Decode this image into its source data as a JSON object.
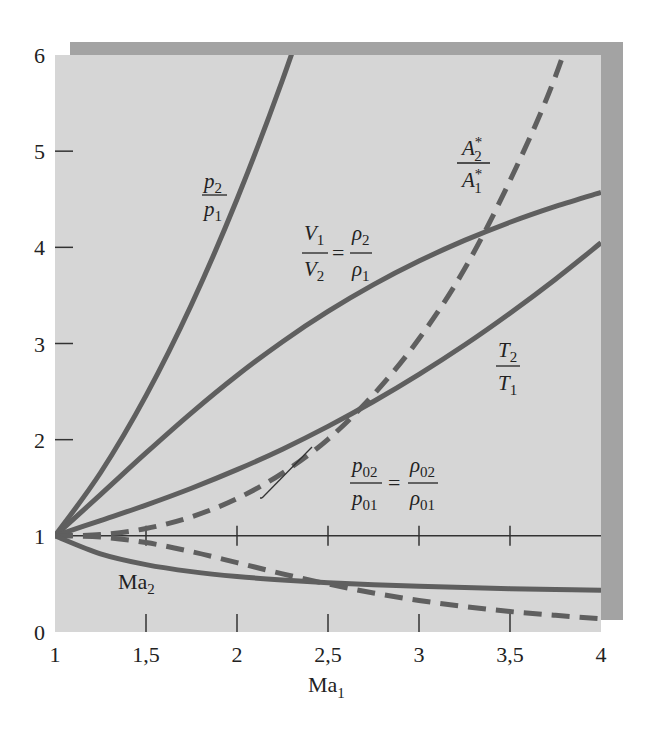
{
  "chart_data": {
    "type": "line",
    "title": "",
    "xlabel": "Ma1",
    "ylabel": "",
    "xlim": [
      1,
      4
    ],
    "ylim": [
      0,
      6
    ],
    "grid": false,
    "legend": "inline curve labels",
    "x_ticks": [
      "1",
      "1,5",
      "2",
      "2,5",
      "3",
      "3,5",
      "4"
    ],
    "y_ticks": [
      "0",
      "1",
      "2",
      "3",
      "4",
      "5",
      "6"
    ],
    "x": [
      1,
      1.25,
      1.5,
      1.75,
      2,
      2.25,
      2.5,
      2.75,
      3,
      3.25,
      3.5,
      3.75,
      4
    ],
    "series": [
      {
        "name": "p2/p1",
        "style": "solid",
        "values": [
          1,
          1.656,
          2.458,
          3.406,
          4.5,
          5.74,
          7.125,
          null,
          null,
          null,
          null,
          null,
          null
        ]
      },
      {
        "name": "V1/V2 = rho2/rho1",
        "style": "solid",
        "values": [
          1,
          1.429,
          1.862,
          2.279,
          2.667,
          3.019,
          3.333,
          3.612,
          3.857,
          4.072,
          4.261,
          4.426,
          4.571
        ]
      },
      {
        "name": "T2/T1",
        "style": "solid",
        "values": [
          1,
          1.159,
          1.32,
          1.495,
          1.688,
          1.901,
          2.138,
          2.397,
          2.679,
          2.984,
          3.315,
          3.669,
          4.047
        ]
      },
      {
        "name": "A2*/A1*",
        "style": "dashed",
        "values": [
          1,
          1.013,
          1.076,
          1.198,
          1.387,
          1.653,
          2.004,
          2.469,
          3.049,
          3.774,
          4.695,
          5.78,
          7.195
        ]
      },
      {
        "name": "p02/p01 = rho02/rho01",
        "style": "dashed",
        "values": [
          1,
          0.987,
          0.93,
          0.835,
          0.721,
          0.605,
          0.499,
          0.405,
          0.328,
          0.265,
          0.213,
          0.173,
          0.139
        ]
      },
      {
        "name": "Ma2",
        "style": "solid",
        "values": [
          1,
          0.813,
          0.701,
          0.628,
          0.577,
          0.541,
          0.513,
          0.492,
          0.475,
          0.462,
          0.451,
          0.442,
          0.435
        ]
      }
    ],
    "reference_line": {
      "name": "y = 1",
      "y": 1
    },
    "annotations": [
      {
        "text": "p2/p1",
        "x": 1.85,
        "y": 4.6
      },
      {
        "text": "V1/V2 = rho2/rho1",
        "x": 2.5,
        "y": 3.9
      },
      {
        "text": "A2*/A1*",
        "x": 3.25,
        "y": 5.0
      },
      {
        "text": "T2/T1",
        "x": 3.5,
        "y": 2.9
      },
      {
        "text": "p02/p01 = rho02/rho01",
        "x": 2.75,
        "y": 1.7
      },
      {
        "text": "Ma2",
        "x": 1.4,
        "y": 0.4
      }
    ]
  },
  "labels": {
    "xlabel_main": "Ma",
    "xlabel_sub": "1",
    "p_ratio": {
      "num": "p",
      "num_sub": "2",
      "den": "p",
      "den_sub": "1"
    },
    "v_ratio": {
      "num": "V",
      "num_sub": "1",
      "den": "V",
      "den_sub": "2",
      "eq": "=",
      "num2": "ρ",
      "num2_sub": "2",
      "den2": "ρ",
      "den2_sub": "1"
    },
    "a_ratio": {
      "num": "A",
      "num_sub": "2",
      "num_sup": "*",
      "den": "A",
      "den_sub": "1",
      "den_sup": "*"
    },
    "t_ratio": {
      "num": "T",
      "num_sub": "2",
      "den": "T",
      "den_sub": "1"
    },
    "p0_ratio": {
      "num": "p",
      "num_sub": "02",
      "den": "p",
      "den_sub": "01",
      "eq": "=",
      "num2": "ρ",
      "num2_sub": "02",
      "den2": "ρ",
      "den2_sub": "01"
    },
    "ma2": {
      "main": "Ma",
      "sub": "2"
    }
  },
  "colors": {
    "plot_bg": "#d6d6d6",
    "frame_shadow": "#a3a3a3",
    "curve": "#5f5f5f",
    "reference": "#333333",
    "text": "#222222"
  }
}
